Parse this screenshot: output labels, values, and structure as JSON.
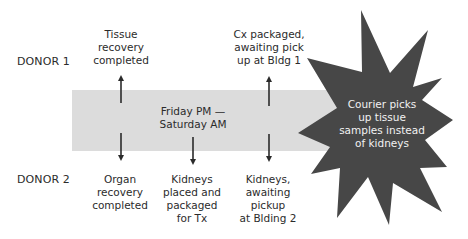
{
  "diagram": {
    "type": "timeline-incident",
    "rows": [
      {
        "id": "donor1",
        "label": "DONOR 1"
      },
      {
        "id": "donor2",
        "label": "DONOR 2"
      }
    ],
    "band": {
      "label_lines": [
        "Friday PM —",
        "Saturday AM"
      ],
      "color": "#dcdcdc"
    },
    "donor1_events": [
      {
        "lines": [
          "Tissue",
          "recovery",
          "completed"
        ],
        "arrow": "up"
      },
      {
        "lines": [
          "Cx packaged,",
          "awaiting pick",
          "up at Bldg 1"
        ],
        "arrow": "up"
      }
    ],
    "donor2_events": [
      {
        "lines": [
          "Organ",
          "recovery",
          "completed"
        ],
        "arrow": "down"
      },
      {
        "lines": [
          "Kidneys",
          "placed and",
          "packaged",
          "for Tx"
        ],
        "arrow": "down"
      },
      {
        "lines": [
          "Kidneys,",
          "awaiting",
          "pickup",
          "at Blding 2"
        ],
        "arrow": "down"
      }
    ],
    "incident": {
      "shape": "starburst",
      "lines": [
        "Courier picks",
        "up tissue",
        "samples instead",
        "of kidneys"
      ],
      "fill_color": "#474747",
      "text_color": "#f2f2f2"
    }
  }
}
